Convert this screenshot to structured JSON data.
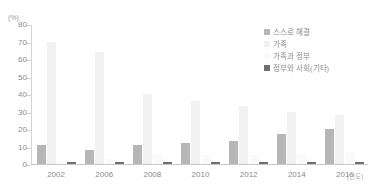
{
  "chart_data": {
    "type": "bar",
    "title": "",
    "subtitle": "",
    "xlabel": "(연도)",
    "ylabel": "(%)",
    "ylim": [
      0,
      80
    ],
    "yticks": [
      80,
      70,
      60,
      50,
      40,
      30,
      20,
      10,
      0
    ],
    "ytick_labels": [
      "80",
      "70",
      "60",
      "50",
      "40",
      "30",
      "20",
      "10",
      "0"
    ],
    "grid": false,
    "legend_position": "top-right",
    "categories": [
      "2002",
      "2006",
      "2008",
      "2010",
      "2012",
      "2014",
      "2016"
    ],
    "series": [
      {
        "name": "스스로 해결",
        "color": "#b6b6b6",
        "values": [
          11,
          8,
          11,
          12,
          13,
          17,
          20
        ]
      },
      {
        "name": "가족",
        "color": "#f1f1f1",
        "values": [
          70,
          64,
          40,
          36,
          33,
          30,
          28
        ]
      },
      {
        "name": "가족과 정부",
        "color": "#fafafa",
        "values": [
          2,
          3,
          6,
          5,
          5,
          6,
          7
        ]
      },
      {
        "name": "정부와 사회(기타)",
        "color": "#6e6e6e",
        "values": [
          1,
          1,
          1,
          1,
          1,
          1,
          1
        ]
      }
    ]
  },
  "axis": {
    "unit_label": "(%)",
    "x_unit_label": "(연도)"
  }
}
